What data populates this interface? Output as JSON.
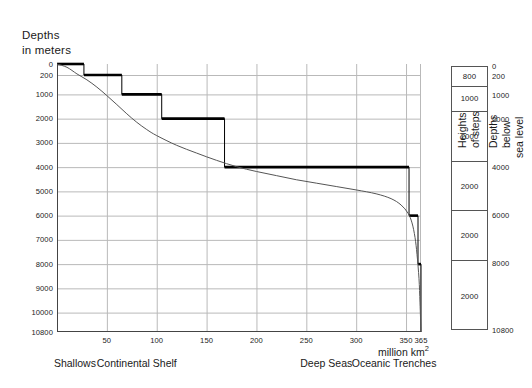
{
  "chart_data": {
    "type": "area",
    "title": "",
    "ylabel": "Depths in meters",
    "xlabel": "million km²",
    "xlim": [
      0,
      365
    ],
    "ylim": [
      0,
      10800
    ],
    "grid": true,
    "y_ticks": [
      {
        "label": "0",
        "value": 0
      },
      {
        "label": "200",
        "value": 200
      },
      {
        "label": "1000",
        "value": 1000
      },
      {
        "label": "2000",
        "value": 2000
      },
      {
        "label": "3000",
        "value": 3000
      },
      {
        "label": "4000",
        "value": 4000
      },
      {
        "label": "5000",
        "value": 5000
      },
      {
        "label": "6000",
        "value": 6000
      },
      {
        "label": "7000",
        "value": 7000
      },
      {
        "label": "8000",
        "value": 8000
      },
      {
        "label": "9000",
        "value": 9000
      },
      {
        "label": "10000",
        "value": 10000
      },
      {
        "label": "10800",
        "value": 10800
      }
    ],
    "x_ticks": [
      {
        "label": "50",
        "value": 50
      },
      {
        "label": "100",
        "value": 100
      },
      {
        "label": "150",
        "value": 150
      },
      {
        "label": "200",
        "value": 200
      },
      {
        "label": "250",
        "value": 250
      },
      {
        "label": "300",
        "value": 300
      },
      {
        "label": "350",
        "value": 350
      },
      {
        "label": "365",
        "value": 365
      }
    ],
    "series": [
      {
        "name": "Depth steps (staircase)",
        "type": "step",
        "steps": [
          {
            "x_start": 0,
            "x_end": 27,
            "depth": 0
          },
          {
            "x_start": 27,
            "x_end": 65,
            "depth": 200
          },
          {
            "x_start": 65,
            "x_end": 105,
            "depth": 1000
          },
          {
            "x_start": 105,
            "x_end": 168,
            "depth": 2000
          },
          {
            "x_start": 168,
            "x_end": 353,
            "depth": 4000
          },
          {
            "x_start": 353,
            "x_end": 362,
            "depth": 6000
          },
          {
            "x_start": 362,
            "x_end": 365,
            "depth": 8000
          },
          {
            "x_start": 365,
            "x_end": 365,
            "depth": 10800
          }
        ]
      },
      {
        "name": "Hypsographic curve",
        "type": "line",
        "points": [
          {
            "x": 0,
            "y": 0
          },
          {
            "x": 10,
            "y": 60
          },
          {
            "x": 20,
            "y": 180
          },
          {
            "x": 30,
            "y": 400
          },
          {
            "x": 40,
            "y": 700
          },
          {
            "x": 50,
            "y": 1050
          },
          {
            "x": 60,
            "y": 1420
          },
          {
            "x": 70,
            "y": 1800
          },
          {
            "x": 80,
            "y": 2150
          },
          {
            "x": 90,
            "y": 2450
          },
          {
            "x": 100,
            "y": 2700
          },
          {
            "x": 120,
            "y": 3100
          },
          {
            "x": 140,
            "y": 3420
          },
          {
            "x": 160,
            "y": 3720
          },
          {
            "x": 180,
            "y": 3980
          },
          {
            "x": 200,
            "y": 4180
          },
          {
            "x": 220,
            "y": 4350
          },
          {
            "x": 240,
            "y": 4520
          },
          {
            "x": 260,
            "y": 4660
          },
          {
            "x": 280,
            "y": 4800
          },
          {
            "x": 300,
            "y": 4940
          },
          {
            "x": 320,
            "y": 5100
          },
          {
            "x": 335,
            "y": 5300
          },
          {
            "x": 345,
            "y": 5560
          },
          {
            "x": 352,
            "y": 5900
          },
          {
            "x": 356,
            "y": 6300
          },
          {
            "x": 359,
            "y": 6900
          },
          {
            "x": 361,
            "y": 7600
          },
          {
            "x": 363,
            "y": 8600
          },
          {
            "x": 364,
            "y": 9600
          },
          {
            "x": 365,
            "y": 10800
          }
        ]
      }
    ],
    "categories_axis": [
      {
        "label": "Shallows",
        "x_center": 18
      },
      {
        "label": "Continental Shelf",
        "x_center": 80
      },
      {
        "label": "Deep Seas",
        "x_center": 270
      },
      {
        "label": "Oceanic Trenches",
        "x_center": 338
      }
    ]
  },
  "panels": {
    "steps": {
      "title_line1": "Heights",
      "title_line2": "of steps",
      "rows": [
        {
          "label": "800",
          "from": 200,
          "to": 1000
        },
        {
          "label": "1000",
          "from": 1000,
          "to": 2000
        },
        {
          "label": "2000",
          "from": 2000,
          "to": 4000
        },
        {
          "label": "2000",
          "from": 4000,
          "to": 6000
        },
        {
          "label": "2000",
          "from": 6000,
          "to": 8000
        },
        {
          "label": "2000",
          "from": 8000,
          "to": 10800
        }
      ]
    },
    "depths": {
      "title_line1": "Depths",
      "title_line2": "below",
      "title_line3": "sea level",
      "ticks": [
        {
          "label": "0",
          "value": 0
        },
        {
          "label": "200",
          "value": 200
        },
        {
          "label": "1000",
          "value": 1000
        },
        {
          "label": "2000",
          "value": 2000
        },
        {
          "label": "4000",
          "value": 4000
        },
        {
          "label": "6000",
          "value": 6000
        },
        {
          "label": "8000",
          "value": 8000
        },
        {
          "label": "10800",
          "value": 10800
        }
      ]
    }
  },
  "colors": {
    "step_line": "#000000",
    "curve": "#555555",
    "grid": "#b9b9b9",
    "axis": "#444444",
    "text": "#1a1a1a"
  }
}
